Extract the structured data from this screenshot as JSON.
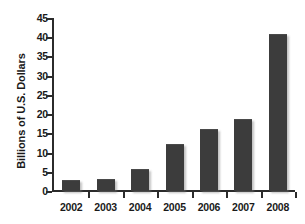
{
  "chart_data": {
    "type": "bar",
    "title": "",
    "subtitle": "",
    "xlabel": "",
    "ylabel": "Billions of U.S. Dollars",
    "categories": [
      "2002",
      "2003",
      "2004",
      "2005",
      "2006",
      "2007",
      "2008"
    ],
    "values": [
      2.6,
      2.8,
      5.5,
      12.0,
      16.0,
      18.5,
      40.5
    ],
    "ylim": [
      0,
      45
    ],
    "yticks": [
      0,
      5,
      10,
      15,
      20,
      25,
      30,
      35,
      40,
      45
    ],
    "ytick_labels": [
      "0",
      "5",
      "10",
      "15",
      "20",
      "25",
      "30",
      "35",
      "40",
      "45"
    ],
    "grid": false,
    "legend": null,
    "legend_position": "none",
    "bar_color": "#3c3c3c",
    "axis_color": "#2b2b2b",
    "background_color": "#ffffff",
    "text_color": "#1a1a1a",
    "annotations": []
  }
}
